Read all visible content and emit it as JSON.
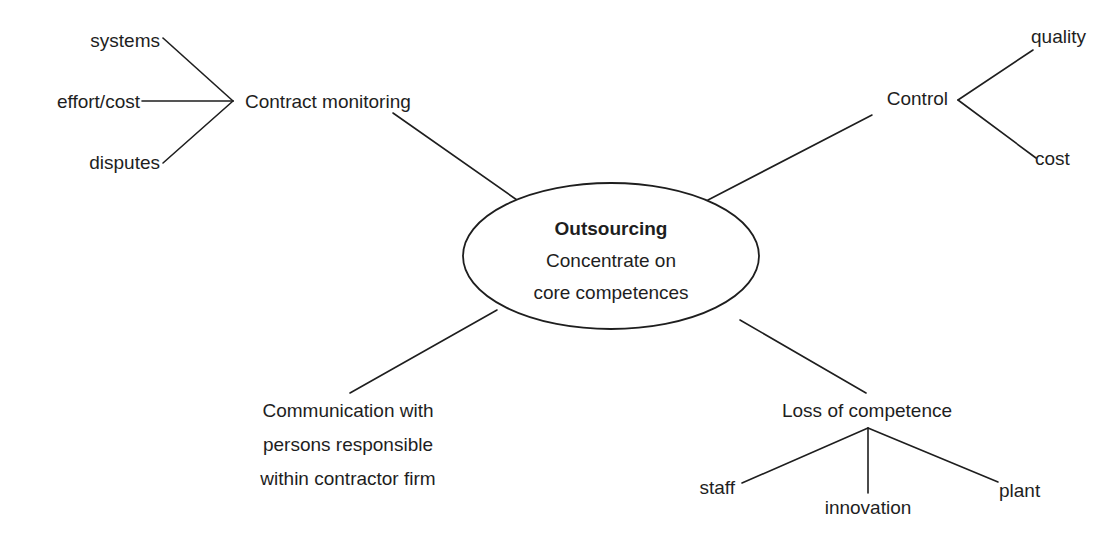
{
  "diagram": {
    "type": "mind-map",
    "colors": {
      "ink": "#1e1e1e",
      "background": "#ffffff"
    },
    "center": {
      "title": "Outsourcing",
      "line1": "Concentrate on",
      "line2": "core competences"
    },
    "branches": {
      "contract_monitoring": {
        "label": "Contract monitoring",
        "children": [
          "systems",
          "effort/cost",
          "disputes"
        ]
      },
      "control": {
        "label": "Control",
        "children": [
          "quality",
          "cost"
        ]
      },
      "communication": {
        "lines": [
          "Communication with",
          "persons responsible",
          "within contractor firm"
        ]
      },
      "loss_of_competence": {
        "label": "Loss of competence",
        "children": [
          "staff",
          "innovation",
          "plant"
        ]
      }
    }
  }
}
